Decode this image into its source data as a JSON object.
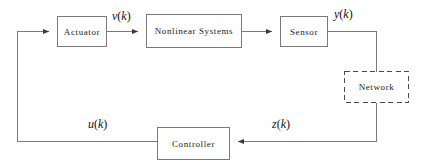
{
  "diagram": {
    "type": "block-diagram",
    "stroke_color": "#6b6b6b",
    "text_color": "#1a1a1a",
    "background": "#ffffff",
    "blocks": [
      {
        "id": "actuator",
        "label": "Actuator",
        "style": "solid",
        "x": 57,
        "y": 16,
        "w": 50,
        "h": 31
      },
      {
        "id": "nonlinear",
        "label": "Nonlinear Systems",
        "style": "solid",
        "x": 146,
        "y": 14,
        "w": 96,
        "h": 34
      },
      {
        "id": "sensor",
        "label": "Sensor",
        "style": "solid",
        "x": 280,
        "y": 16,
        "w": 48,
        "h": 31
      },
      {
        "id": "network",
        "label": "Network",
        "style": "dashed",
        "x": 344,
        "y": 71,
        "w": 65,
        "h": 32
      },
      {
        "id": "controller",
        "label": "Controller",
        "style": "solid",
        "x": 157,
        "y": 127,
        "w": 73,
        "h": 33
      }
    ],
    "signals": [
      {
        "id": "vk",
        "var": "v",
        "arg": "k",
        "text": "v(k)",
        "from": "actuator",
        "to": "nonlinear"
      },
      {
        "id": "yk",
        "var": "y",
        "arg": "k",
        "text": "y(k)",
        "from": "sensor",
        "to": "network"
      },
      {
        "id": "zk",
        "var": "z",
        "arg": "k",
        "text": "z(k)",
        "from": "network",
        "to": "controller"
      },
      {
        "id": "uk",
        "var": "u",
        "arg": "k",
        "text": "u(k)",
        "from": "controller",
        "to": "actuator"
      }
    ],
    "connections": [
      {
        "id": "actuator-to-nonlinear",
        "arrow": true
      },
      {
        "id": "nonlinear-to-sensor",
        "arrow": true
      },
      {
        "id": "sensor-to-network",
        "arrow": false
      },
      {
        "id": "network-to-controller",
        "arrow": true
      },
      {
        "id": "controller-to-actuator",
        "arrow": true
      }
    ]
  }
}
